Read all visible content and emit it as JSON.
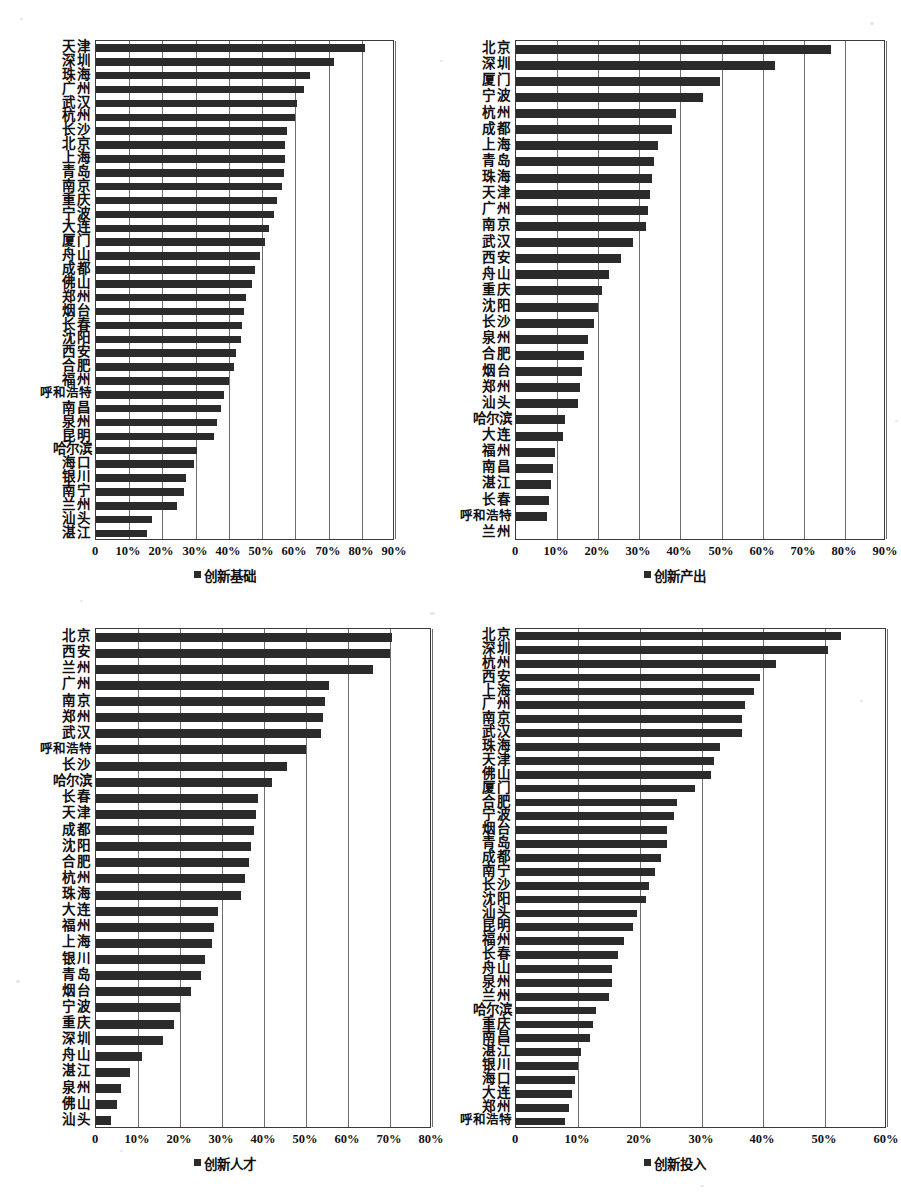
{
  "page": {
    "background": "#ffffff",
    "bar_color": "#2b2b2b",
    "grid_color": "#6d6d6d",
    "axis_color": "#3a3a3a"
  },
  "chart_data": [
    {
      "id": "chart-innovation-base",
      "type": "bar",
      "orientation": "horizontal",
      "title": "",
      "legend": "创新基础",
      "legend_position": "bottom-center",
      "xlabel": "",
      "ylabel": "",
      "xlim": [
        0,
        90
      ],
      "xticks": [
        "0",
        "10%",
        "20%",
        "30%",
        "40%",
        "50%",
        "60%",
        "70%",
        "80%",
        "90%"
      ],
      "xtick_values": [
        0,
        10,
        20,
        30,
        40,
        50,
        60,
        70,
        80,
        90
      ],
      "grid": true,
      "unit": "%",
      "categories": [
        "天津",
        "深圳",
        "珠海",
        "广州",
        "武汉",
        "杭州",
        "长沙",
        "北京",
        "上海",
        "青岛",
        "南京",
        "重庆",
        "宁波",
        "大连",
        "厦门",
        "舟山",
        "成都",
        "佛山",
        "郑州",
        "烟台",
        "长春",
        "沈阳",
        "西安",
        "合肥",
        "福州",
        "呼和浩特",
        "南昌",
        "泉州",
        "昆明",
        "哈尔滨",
        "海口",
        "银川",
        "南宁",
        "兰州",
        "汕头",
        "湛江"
      ],
      "values": [
        81.0,
        71.5,
        64.5,
        62.5,
        60.5,
        60.0,
        57.5,
        57.0,
        57.0,
        56.5,
        56.0,
        54.5,
        53.5,
        52.0,
        51.0,
        49.5,
        48.0,
        47.0,
        45.0,
        44.5,
        44.0,
        43.5,
        42.0,
        41.5,
        40.0,
        38.5,
        37.5,
        36.5,
        35.5,
        30.5,
        29.5,
        27.0,
        26.5,
        24.5,
        17.0,
        15.5
      ]
    },
    {
      "id": "chart-innovation-output",
      "type": "bar",
      "orientation": "horizontal",
      "title": "",
      "legend": "创新产出",
      "legend_position": "bottom-center",
      "xlabel": "",
      "ylabel": "",
      "xlim": [
        0,
        90
      ],
      "xticks": [
        "0",
        "10%",
        "20%",
        "30%",
        "40%",
        "50%",
        "60%",
        "70%",
        "80%",
        "90%"
      ],
      "xtick_values": [
        0,
        10,
        20,
        30,
        40,
        50,
        60,
        70,
        80,
        90
      ],
      "grid": true,
      "unit": "%",
      "categories": [
        "北京",
        "深圳",
        "厦门",
        "宁波",
        "杭州",
        "成都",
        "上海",
        "青岛",
        "珠海",
        "天津",
        "广州",
        "南京",
        "武汉",
        "西安",
        "舟山",
        "重庆",
        "沈阳",
        "长沙",
        "泉州",
        "合肥",
        "烟台",
        "郑州",
        "汕头",
        "哈尔滨",
        "大连",
        "福州",
        "南昌",
        "湛江",
        "长春",
        "呼和浩特",
        "兰州"
      ],
      "values": [
        76.5,
        63.0,
        49.5,
        45.5,
        39.0,
        38.0,
        34.5,
        33.5,
        33.0,
        32.5,
        32.0,
        31.5,
        28.5,
        25.5,
        22.5,
        21.0,
        20.0,
        19.0,
        17.5,
        16.5,
        16.0,
        15.5,
        15.0,
        12.0,
        11.5,
        9.5,
        9.0,
        8.5,
        8.0,
        7.5,
        0.0
      ]
    },
    {
      "id": "chart-innovation-talent",
      "type": "bar",
      "orientation": "horizontal",
      "title": "",
      "legend": "创新人才",
      "legend_position": "bottom-center",
      "xlabel": "",
      "ylabel": "",
      "xlim": [
        0,
        80
      ],
      "xticks": [
        "0",
        "10%",
        "20%",
        "30%",
        "40%",
        "50%",
        "60%",
        "70%",
        "80%"
      ],
      "xtick_values": [
        0,
        10,
        20,
        30,
        40,
        50,
        60,
        70,
        80
      ],
      "grid": true,
      "unit": "%",
      "categories": [
        "北京",
        "西安",
        "兰州",
        "广州",
        "南京",
        "郑州",
        "武汉",
        "呼和浩特",
        "长沙",
        "哈尔滨",
        "长春",
        "天津",
        "成都",
        "沈阳",
        "合肥",
        "杭州",
        "珠海",
        "大连",
        "福州",
        "上海",
        "银川",
        "青岛",
        "烟台",
        "宁波",
        "重庆",
        "深圳",
        "舟山",
        "湛江",
        "泉州",
        "佛山",
        "汕头"
      ],
      "values": [
        70.5,
        70.0,
        66.0,
        55.5,
        54.5,
        54.0,
        53.5,
        50.0,
        45.5,
        42.0,
        38.5,
        38.0,
        37.5,
        37.0,
        36.5,
        35.5,
        34.5,
        29.0,
        28.0,
        27.5,
        26.0,
        25.0,
        22.5,
        20.0,
        18.5,
        16.0,
        11.0,
        8.0,
        6.0,
        5.0,
        3.5
      ]
    },
    {
      "id": "chart-innovation-input",
      "type": "bar",
      "orientation": "horizontal",
      "title": "",
      "legend": "创新投入",
      "legend_position": "bottom-center",
      "xlabel": "",
      "ylabel": "",
      "xlim": [
        0,
        60
      ],
      "xticks": [
        "0",
        "10%",
        "20%",
        "30%",
        "40%",
        "50%",
        "60%"
      ],
      "xtick_values": [
        0,
        10,
        20,
        30,
        40,
        50,
        60
      ],
      "grid": true,
      "unit": "%",
      "categories": [
        "北京",
        "深圳",
        "杭州",
        "西安",
        "上海",
        "广州",
        "南京",
        "武汉",
        "珠海",
        "天津",
        "佛山",
        "厦门",
        "合肥",
        "宁波",
        "烟台",
        "青岛",
        "成都",
        "南宁",
        "长沙",
        "沈阳",
        "汕头",
        "昆明",
        "福州",
        "长春",
        "舟山",
        "泉州",
        "兰州",
        "哈尔滨",
        "重庆",
        "南昌",
        "湛江",
        "银川",
        "海口",
        "大连",
        "郑州",
        "呼和浩特"
      ],
      "values": [
        52.5,
        50.5,
        42.0,
        39.5,
        38.5,
        37.0,
        36.5,
        36.5,
        33.0,
        32.0,
        31.5,
        29.0,
        26.0,
        25.5,
        24.5,
        24.5,
        23.5,
        22.5,
        21.5,
        21.0,
        19.5,
        19.0,
        17.5,
        16.5,
        15.5,
        15.5,
        15.0,
        13.0,
        12.5,
        12.0,
        10.5,
        10.0,
        9.5,
        9.0,
        8.5,
        8.0
      ]
    }
  ]
}
